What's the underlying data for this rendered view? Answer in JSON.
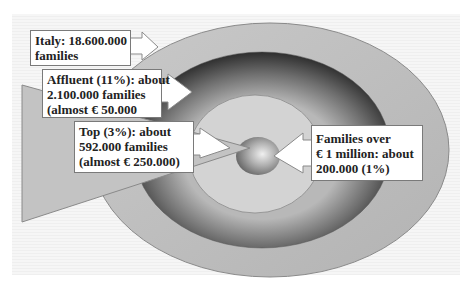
{
  "diagram": {
    "type": "concentric-ellipses-wealth-segments",
    "layers": [
      {
        "name": "Italy",
        "label_lines": [
          "Italy: 18.600.000",
          "families"
        ]
      },
      {
        "name": "Affluent",
        "label_lines": [
          "Affluent (11%): about",
          "2.100.000 families",
          "(almost € 50.000"
        ]
      },
      {
        "name": "Top",
        "label_lines": [
          "Top (3%): about",
          "592.000 families",
          "(almost € 250.000)"
        ]
      },
      {
        "name": "Over 1 million",
        "label_lines": [
          "Families over",
          "€ 1 million: about",
          "200.000 (1%)"
        ]
      }
    ],
    "colors": {
      "outer_ring": "#bdbdbd",
      "dark_ring_edge": "#3a3a3a",
      "dark_ring_light": "#9a9a9a",
      "inner_ellipse": "#d4d4d4",
      "sphere": "#8e8e8e",
      "triangle": "#c2c2c2",
      "callout_bg": "#ffffff",
      "callout_border": "#7a7a7a"
    }
  }
}
